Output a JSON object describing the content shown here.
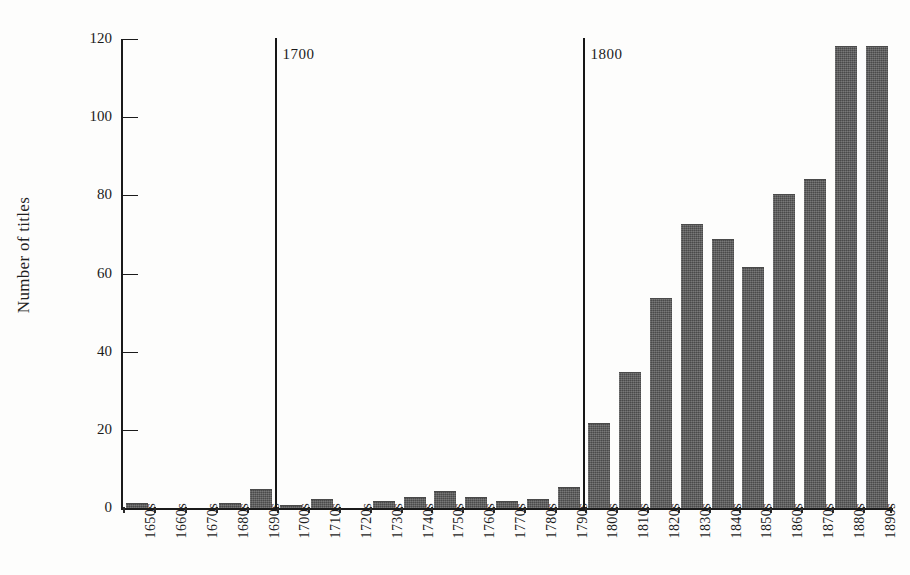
{
  "figure": {
    "ghost_text": "",
    "y_axis_title": "Number of titles",
    "y_ticks": [
      "0",
      "20",
      "40",
      "60",
      "80",
      "100",
      "120"
    ],
    "era_markers": [
      {
        "label": "1700",
        "at_category": "1700s"
      },
      {
        "label": "1800",
        "at_category": "1800s"
      }
    ]
  },
  "chart_data": {
    "type": "bar",
    "title": "",
    "subtitle": "",
    "xlabel": "",
    "ylabel": "Number of titles",
    "ylim": [
      0,
      120
    ],
    "yticks": [
      0,
      20,
      40,
      60,
      80,
      100,
      120
    ],
    "grid": false,
    "legend": null,
    "bar_color": "#5a5a5a",
    "categories": [
      "1650s",
      "1660s",
      "1670s",
      "1680s",
      "1690s",
      "1700s",
      "1710s",
      "1720s",
      "1730s",
      "1740s",
      "1750s",
      "1760s",
      "1770s",
      "1780s",
      "1790s",
      "1800s",
      "1810s",
      "1820s",
      "1830s",
      "1840s",
      "1850s",
      "1860s",
      "1870s",
      "1880s",
      "1890s"
    ],
    "values": [
      1,
      0,
      0,
      1,
      4.5,
      0.5,
      2,
      0,
      1.5,
      2.5,
      4,
      2.5,
      1.5,
      2,
      5,
      21.5,
      34.5,
      53.5,
      72.5,
      68.5,
      61.5,
      80,
      84,
      118,
      118
    ],
    "annotations": [
      {
        "text": "1700",
        "type": "vertical-divider",
        "x": "1700s"
      },
      {
        "text": "1800",
        "type": "vertical-divider",
        "x": "1800s"
      }
    ]
  }
}
